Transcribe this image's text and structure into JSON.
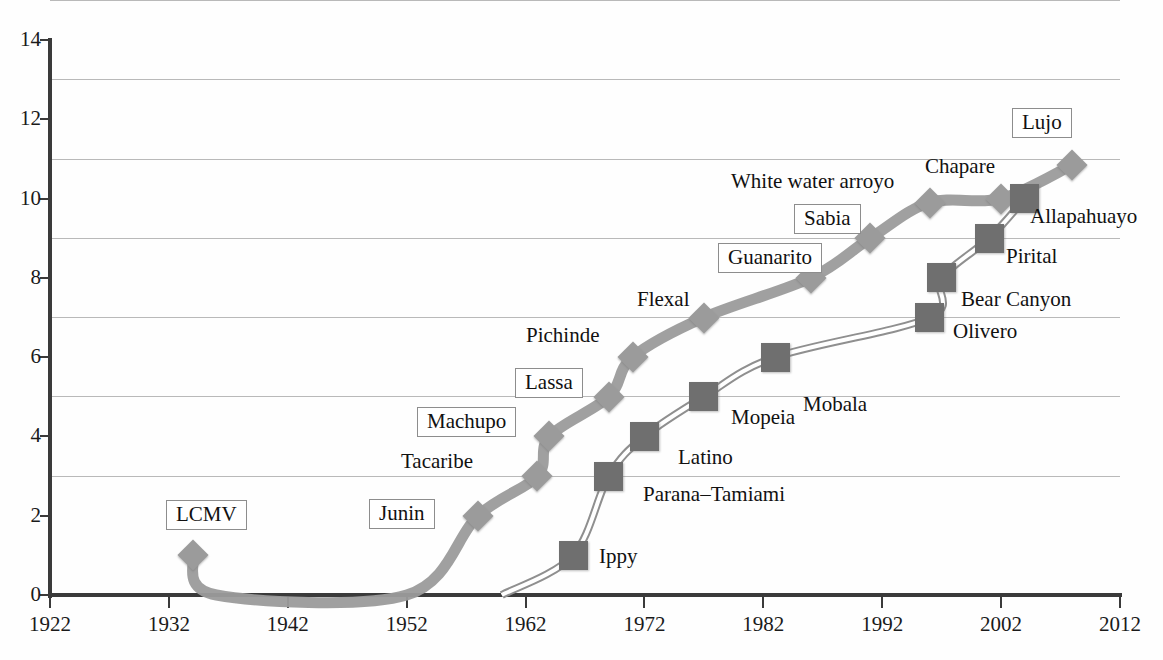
{
  "chart_data": {
    "type": "line",
    "title": "",
    "subtitle": "",
    "xlabel": "",
    "ylabel": "",
    "xlim": [
      1922,
      2012
    ],
    "ylim": [
      0,
      14
    ],
    "grid": true,
    "legend_position": "none",
    "x_ticks": [
      "1922",
      "1932",
      "1942",
      "1952",
      "1962",
      "1972",
      "1982",
      "1992",
      "2002",
      "2012"
    ],
    "y_ticks": [
      "0",
      "2",
      "4",
      "6",
      "8",
      "10",
      "12",
      "14"
    ],
    "series": [
      {
        "name": "New World arenaviruses",
        "marker": "diamond",
        "color": "#9b9b9b",
        "points": [
          {
            "x": 1934,
            "y": 1,
            "label": "LCMV"
          },
          {
            "x": 1936,
            "y": 0,
            "label": ""
          },
          {
            "x": 1952,
            "y": 0,
            "label": ""
          },
          {
            "x": 1958,
            "y": 2,
            "label": "Junin"
          },
          {
            "x": 1963,
            "y": 3,
            "label": "Tacaribe"
          },
          {
            "x": 1964,
            "y": 4,
            "label": "Machupo"
          },
          {
            "x": 1969,
            "y": 5,
            "label": "Lassa"
          },
          {
            "x": 1971,
            "y": 6,
            "label": "Pichinde"
          },
          {
            "x": 1977,
            "y": 7,
            "label": "Flexal"
          },
          {
            "x": 1986,
            "y": 8,
            "label": "Guanarito"
          },
          {
            "x": 1991,
            "y": 9,
            "label": "Sabia"
          },
          {
            "x": 1996,
            "y": 9.9,
            "label": "Chapare"
          },
          {
            "x": 2002,
            "y": 10,
            "label": "White water arroyo"
          },
          {
            "x": 2008,
            "y": 10.85,
            "label": "Lujo"
          }
        ]
      },
      {
        "name": "Old World arenaviruses",
        "marker": "square",
        "color": "#6f6f6f",
        "points": [
          {
            "x": 1960,
            "y": 0,
            "label": ""
          },
          {
            "x": 1966,
            "y": 1,
            "label": "Ippy"
          },
          {
            "x": 1969,
            "y": 3,
            "label": "Parana-Tamiami"
          },
          {
            "x": 1972,
            "y": 4,
            "label": "Latino"
          },
          {
            "x": 1977,
            "y": 5,
            "label": "Mopeia"
          },
          {
            "x": 1983,
            "y": 6,
            "label": "Mobala"
          },
          {
            "x": 1996,
            "y": 7,
            "label": "Olivero"
          },
          {
            "x": 1997,
            "y": 8,
            "label": "Bear Canyon"
          },
          {
            "x": 2001,
            "y": 9,
            "label": "Pirital"
          },
          {
            "x": 2004,
            "y": 10,
            "label": "Allapahuayo"
          }
        ]
      }
    ],
    "annotations": [
      {
        "text": "LCMV",
        "boxed": true,
        "x": 166,
        "y": 500
      },
      {
        "text": "Junin",
        "boxed": true,
        "x": 369,
        "y": 499
      },
      {
        "text": "Tacaribe",
        "boxed": false,
        "x": 401,
        "y": 450
      },
      {
        "text": "Machupo",
        "boxed": true,
        "x": 417,
        "y": 407
      },
      {
        "text": "Lassa",
        "boxed": true,
        "x": 515,
        "y": 368
      },
      {
        "text": "Pichinde",
        "boxed": false,
        "x": 526,
        "y": 324
      },
      {
        "text": "Flexal",
        "boxed": false,
        "x": 637,
        "y": 288
      },
      {
        "text": "Guanarito",
        "boxed": true,
        "x": 718,
        "y": 243
      },
      {
        "text": "Sabia",
        "boxed": true,
        "x": 794,
        "y": 204
      },
      {
        "text": "White water arroyo",
        "boxed": false,
        "x": 731,
        "y": 170
      },
      {
        "text": "Chapare",
        "boxed": false,
        "x": 925,
        "y": 155
      },
      {
        "text": "Lujo",
        "boxed": true,
        "x": 1012,
        "y": 108
      },
      {
        "text": "Allapahuayo",
        "boxed": false,
        "x": 1030,
        "y": 205
      },
      {
        "text": "Pirital",
        "boxed": false,
        "x": 1006,
        "y": 245
      },
      {
        "text": "Bear Canyon",
        "boxed": false,
        "x": 961,
        "y": 288
      },
      {
        "text": "Olivero",
        "boxed": false,
        "x": 953,
        "y": 320
      },
      {
        "text": "Mobala",
        "boxed": false,
        "x": 803,
        "y": 393
      },
      {
        "text": "Mopeia",
        "boxed": false,
        "x": 731,
        "y": 406
      },
      {
        "text": "Latino",
        "boxed": false,
        "x": 678,
        "y": 446
      },
      {
        "text": "Parana–Tamiami",
        "boxed": false,
        "x": 643,
        "y": 483
      },
      {
        "text": "Ippy",
        "boxed": false,
        "x": 599,
        "y": 545
      }
    ]
  },
  "axes": {
    "y_ticks": [
      "0",
      "2",
      "4",
      "6",
      "8",
      "10",
      "12",
      "14"
    ],
    "x_ticks": [
      "1922",
      "1932",
      "1942",
      "1952",
      "1962",
      "1972",
      "1982",
      "1992",
      "2002",
      "2012"
    ]
  },
  "colors": {
    "diamond_series": "#9b9b9b",
    "square_series": "#6f6f6f",
    "axis": "#3a3a3a",
    "gridline": "#b9b9b9",
    "label_box_border": "#8d8d8d"
  }
}
